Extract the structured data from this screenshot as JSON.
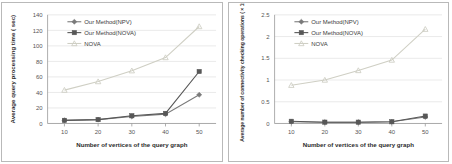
{
  "figure": {
    "title": "",
    "panel_count": 2,
    "background_color": "#ffffff",
    "border_color": "#b9b9b9"
  },
  "colors": {
    "npv": "#7a7a7a",
    "nova_ours": "#575757",
    "nova": "#cfcfc4",
    "grid": "#dcdcdc",
    "axis": "#9a9a9a",
    "text": "#3a3a3a"
  },
  "chart_data": [
    {
      "id": "left",
      "type": "line",
      "title": "",
      "xlabel": "Number of vertices of the query graph",
      "ylabel": "Average query processing time ( sec)",
      "categories": [
        10,
        20,
        30,
        40,
        50
      ],
      "xticklabels": [
        "10",
        "20",
        "30",
        "40",
        "50"
      ],
      "yticklabels": [
        "0",
        "20",
        "40",
        "60",
        "80",
        "100",
        "120",
        "140"
      ],
      "ylim": [
        0,
        140
      ],
      "xlim": [
        5,
        55
      ],
      "ytick_step": 20,
      "grid": true,
      "legend_position": "upper-left-inside",
      "series": [
        {
          "name": "Our Method(NPV)",
          "marker": "diamond",
          "color": "#7a7a7a",
          "values": [
            4,
            5,
            9,
            12,
            37
          ]
        },
        {
          "name": "Our Method(NOVA)",
          "marker": "square",
          "color": "#575757",
          "values": [
            4,
            5,
            10,
            13,
            67
          ]
        },
        {
          "name": "NOVA",
          "marker": "triangle",
          "color": "#cfcfc4",
          "values": [
            43,
            54,
            68,
            85,
            125
          ]
        }
      ]
    },
    {
      "id": "right",
      "type": "line",
      "title": "",
      "xlabel": "Number of vertices of the query graph",
      "ylabel": "Average number of connectivity checking operations ( × 10⁵)",
      "categories": [
        10,
        20,
        30,
        40,
        50
      ],
      "xticklabels": [
        "10",
        "20",
        "30",
        "40",
        "50"
      ],
      "yticklabels": [
        "0",
        "0.5",
        "1",
        "1.5",
        "2",
        "2.5"
      ],
      "ylim": [
        0,
        2.5
      ],
      "xlim": [
        5,
        55
      ],
      "ytick_step": 0.5,
      "grid": true,
      "legend_position": "upper-left-inside",
      "series": [
        {
          "name": "Our Method(NPV)",
          "marker": "diamond",
          "color": "#7a7a7a",
          "values": [
            0.04,
            0.03,
            0.03,
            0.04,
            0.15
          ]
        },
        {
          "name": "Our Method(NOVA)",
          "marker": "square",
          "color": "#575757",
          "values": [
            0.05,
            0.03,
            0.03,
            0.04,
            0.17
          ]
        },
        {
          "name": "NOVA",
          "marker": "triangle",
          "color": "#cfcfc4",
          "values": [
            0.88,
            1.0,
            1.22,
            1.46,
            2.17
          ]
        }
      ]
    }
  ]
}
